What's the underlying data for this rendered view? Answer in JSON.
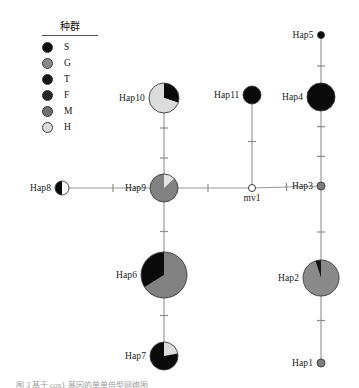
{
  "figure": {
    "width": 359,
    "height": 388,
    "background": "#ffffff",
    "caption": "图 3  基于 cox1 基因的单单倍型网络图"
  },
  "legend": {
    "title": "种群",
    "items": [
      {
        "label": "S",
        "color": "#0a0a0a"
      },
      {
        "label": "G",
        "color": "#8a8a8a"
      },
      {
        "label": "T",
        "color": "#141414"
      },
      {
        "label": "F",
        "color": "#262626"
      },
      {
        "label": "M",
        "color": "#6e6e6e"
      },
      {
        "label": "H",
        "color": "#dcdcdc"
      }
    ]
  },
  "chart_data": {
    "type": "network",
    "legend_title": "种群",
    "populations": [
      "S",
      "G",
      "T",
      "F",
      "M",
      "H"
    ],
    "population_colors": {
      "S": "#0a0a0a",
      "G": "#8a8a8a",
      "T": "#141414",
      "F": "#262626",
      "M": "#6e6e6e",
      "H": "#dcdcdc"
    },
    "nodes": [
      {
        "id": "Hap5",
        "label": "Hap5",
        "x": 321,
        "y": 35,
        "radius": 3.5,
        "label_pos": "left",
        "type": "haplotype",
        "slices": [
          {
            "pop": "S",
            "fraction": 1.0,
            "color": "#0a0a0a"
          }
        ]
      },
      {
        "id": "Hap10",
        "label": "Hap10",
        "x": 164,
        "y": 98,
        "radius": 15,
        "label_pos": "left",
        "type": "haplotype",
        "slices": [
          {
            "pop": "S",
            "fraction": 0.3,
            "color": "#0a0a0a"
          },
          {
            "pop": "H",
            "fraction": 0.7,
            "color": "#dcdcdc"
          }
        ]
      },
      {
        "id": "Hap11",
        "label": "Hap11",
        "x": 252,
        "y": 95,
        "radius": 9,
        "label_pos": "left",
        "type": "haplotype",
        "slices": [
          {
            "pop": "S",
            "fraction": 1.0,
            "color": "#0a0a0a"
          }
        ]
      },
      {
        "id": "Hap4",
        "label": "Hap4",
        "x": 321,
        "y": 97,
        "radius": 14,
        "label_pos": "left",
        "type": "haplotype",
        "slices": [
          {
            "pop": "S",
            "fraction": 1.0,
            "color": "#0a0a0a"
          }
        ]
      },
      {
        "id": "Hap8",
        "label": "Hap8",
        "x": 62,
        "y": 188,
        "radius": 7,
        "label_pos": "left",
        "type": "haplotype",
        "slices": [
          {
            "pop": "H",
            "fraction": 0.5,
            "color": "#fbfbfb"
          },
          {
            "pop": "S",
            "fraction": 0.5,
            "color": "#0a0a0a"
          }
        ]
      },
      {
        "id": "Hap9",
        "label": "Hap9",
        "x": 164,
        "y": 188,
        "radius": 14,
        "label_pos": "left",
        "type": "haplotype",
        "slices": [
          {
            "pop": "H",
            "fraction": 0.13,
            "color": "#e4e4e4"
          },
          {
            "pop": "M",
            "fraction": 0.87,
            "color": "#818181"
          }
        ]
      },
      {
        "id": "mv1",
        "label": "mv1",
        "x": 252,
        "y": 188,
        "radius": 3.5,
        "label_pos": "below",
        "type": "median-vector",
        "slices": [
          {
            "pop": "",
            "fraction": 1.0,
            "color": "#ffffff"
          }
        ]
      },
      {
        "id": "Hap3",
        "label": "Hap3",
        "x": 321,
        "y": 186,
        "radius": 4,
        "label_pos": "left",
        "type": "haplotype",
        "slices": [
          {
            "pop": "M",
            "fraction": 1.0,
            "color": "#7d7d7d"
          }
        ]
      },
      {
        "id": "Hap6",
        "label": "Hap6",
        "x": 164,
        "y": 275,
        "radius": 23,
        "label_pos": "left",
        "type": "haplotype",
        "slices": [
          {
            "pop": "M",
            "fraction": 0.66,
            "color": "#818181"
          },
          {
            "pop": "S",
            "fraction": 0.34,
            "color": "#0a0a0a"
          }
        ]
      },
      {
        "id": "Hap2",
        "label": "Hap2",
        "x": 321,
        "y": 278,
        "radius": 18,
        "label_pos": "left",
        "type": "haplotype",
        "slices": [
          {
            "pop": "M",
            "fraction": 0.95,
            "color": "#8a8a8a"
          },
          {
            "pop": "S",
            "fraction": 0.05,
            "color": "#151515"
          }
        ]
      },
      {
        "id": "Hap7",
        "label": "Hap7",
        "x": 164,
        "y": 356,
        "radius": 14,
        "label_pos": "left",
        "type": "haplotype",
        "slices": [
          {
            "pop": "H",
            "fraction": 0.22,
            "color": "#dcdcdc"
          },
          {
            "pop": "S",
            "fraction": 0.78,
            "color": "#0a0a0a"
          }
        ]
      },
      {
        "id": "Hap1",
        "label": "Hap1",
        "x": 321,
        "y": 363,
        "radius": 4,
        "label_pos": "left",
        "type": "haplotype",
        "slices": [
          {
            "pop": "M",
            "fraction": 1.0,
            "color": "#7d7d7d"
          }
        ]
      }
    ],
    "edges": [
      {
        "from": "Hap10",
        "to": "Hap9",
        "mutations": 2
      },
      {
        "from": "Hap8",
        "to": "Hap9",
        "mutations": 1
      },
      {
        "from": "Hap9",
        "to": "mv1",
        "mutations": 1
      },
      {
        "from": "mv1",
        "to": "Hap3",
        "mutations": 1
      },
      {
        "from": "Hap11",
        "to": "mv1",
        "mutations": 1
      },
      {
        "from": "Hap5",
        "to": "Hap4",
        "mutations": 1
      },
      {
        "from": "Hap4",
        "to": "Hap3",
        "mutations": 2
      },
      {
        "from": "Hap9",
        "to": "Hap6",
        "mutations": 1
      },
      {
        "from": "Hap6",
        "to": "Hap7",
        "mutations": 1
      },
      {
        "from": "Hap3",
        "to": "Hap2",
        "mutations": 1
      },
      {
        "from": "Hap2",
        "to": "Hap1",
        "mutations": 1
      }
    ],
    "edge_color": "#9a9a9a",
    "tick_color": "#8c8c8c",
    "node_stroke": "#3a3a3a"
  }
}
